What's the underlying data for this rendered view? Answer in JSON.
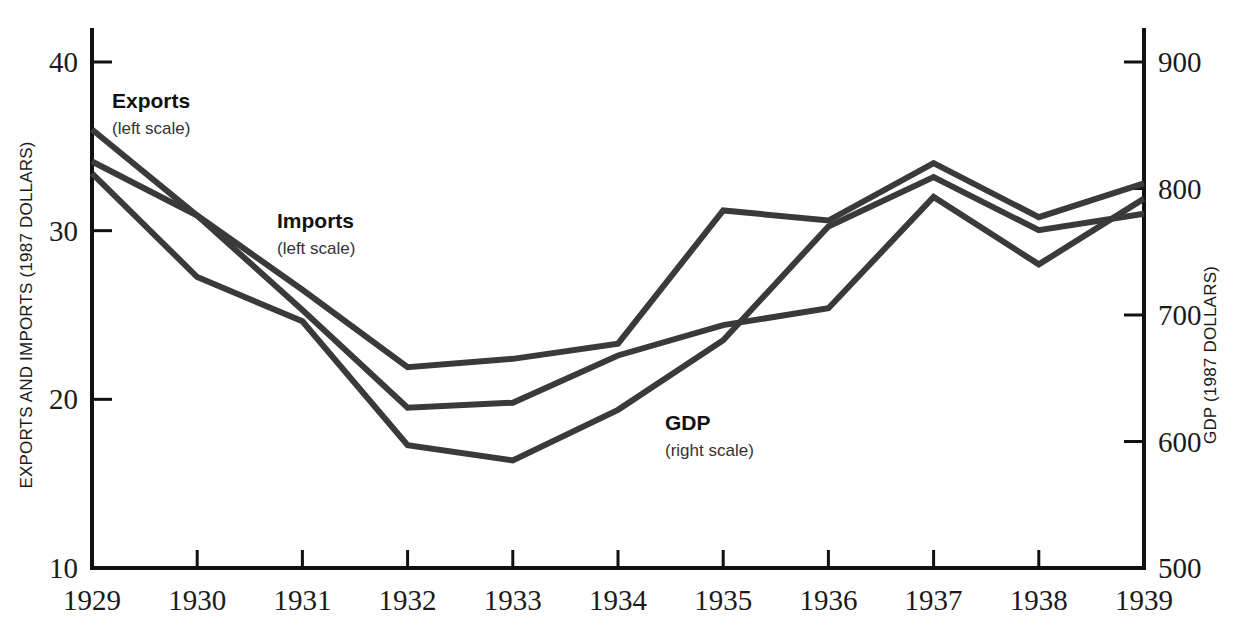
{
  "chart_data": {
    "type": "line",
    "title": "",
    "xlabel": "",
    "x": [
      1929,
      1930,
      1931,
      1932,
      1933,
      1934,
      1935,
      1936,
      1937,
      1938,
      1939
    ],
    "xticklabels": [
      "1929",
      "1930",
      "1931",
      "1932",
      "1933",
      "1934",
      "1935",
      "1936",
      "1937",
      "1938",
      "1939"
    ],
    "grid": false,
    "legend_position": "inline-annotations",
    "left_axis": {
      "label": "EXPORTS AND IMPORTS (1987 DOLLARS)",
      "ylim": [
        10,
        40
      ],
      "ticks": [
        10,
        20,
        30,
        40
      ],
      "ticklabels": [
        "10",
        "20",
        "30",
        "40"
      ]
    },
    "right_axis": {
      "label": "GDP (1987 DOLLARS)",
      "ylim": [
        500,
        900
      ],
      "ticks": [
        500,
        600,
        700,
        800,
        900
      ],
      "ticklabels": [
        "500",
        "600",
        "700",
        "800",
        "900"
      ]
    },
    "series": [
      {
        "name": "Exports",
        "sublabel": "(left scale)",
        "axis": "left",
        "color": "#3a3a3a",
        "values": [
          36.0,
          30.9,
          26.5,
          21.9,
          22.4,
          23.3,
          31.2,
          30.6,
          34.0,
          30.8,
          32.8
        ]
      },
      {
        "name": "Imports",
        "sublabel": "(left scale)",
        "axis": "left",
        "color": "#3a3a3a",
        "values": [
          34.1,
          30.9,
          25.3,
          19.5,
          19.8,
          22.6,
          24.4,
          25.4,
          32.0,
          28.0,
          31.9
        ]
      },
      {
        "name": "GDP",
        "sublabel": "(right scale)",
        "axis": "right",
        "color": "#3a3a3a",
        "values": [
          812,
          730,
          695,
          597,
          585,
          625,
          680,
          770,
          809,
          767,
          780
        ]
      }
    ],
    "annotations": [
      {
        "text": "Exports",
        "sub": "(left scale)",
        "x": 112,
        "y": 108
      },
      {
        "text": "Imports",
        "sub": "(left scale)",
        "x": 277,
        "y": 228
      },
      {
        "text": "GDP",
        "sub": "(right scale)",
        "x": 665,
        "y": 430
      }
    ]
  }
}
